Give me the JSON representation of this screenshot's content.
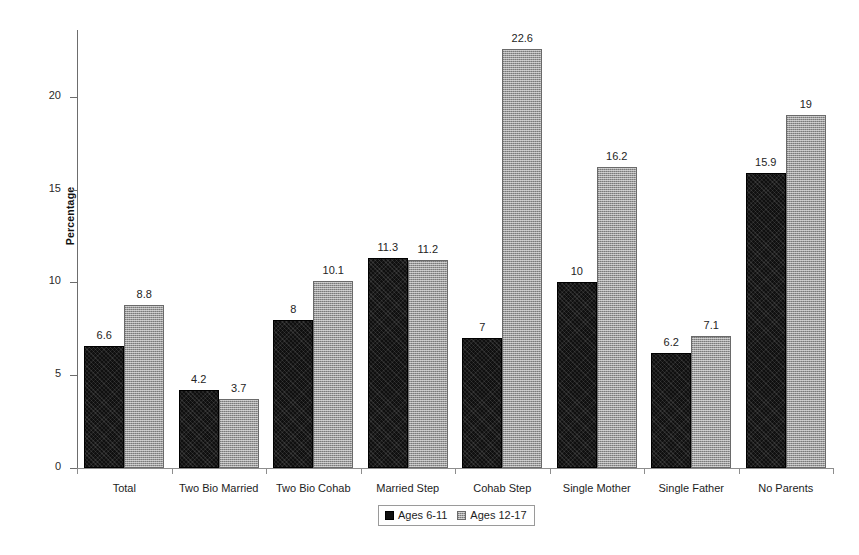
{
  "chart_data": {
    "type": "bar",
    "title": "",
    "xlabel": "",
    "ylabel": "Percentage",
    "ylim": [
      0,
      23.6
    ],
    "yticks": [
      0,
      5,
      10,
      15,
      20
    ],
    "ytick_labels": [
      "0",
      "5",
      "10",
      "15",
      "20"
    ],
    "grid": false,
    "legend_position": "bottom-center",
    "categories": [
      "Total",
      "Two Bio Married",
      "Two Bio Cohab",
      "Married Step",
      "Cohab Step",
      "Single Mother",
      "Single Father",
      "No Parents"
    ],
    "series": [
      {
        "name": "Ages 6-11",
        "color": "#101010",
        "values": [
          6.6,
          4.2,
          8,
          11.3,
          7,
          10,
          6.2,
          15.9
        ],
        "value_labels": [
          "6.6",
          "4.2",
          "8",
          "11.3",
          "7",
          "10",
          "6.2",
          "15.9"
        ]
      },
      {
        "name": "Ages 12-17",
        "color": "#9b9b9b",
        "values": [
          8.8,
          3.7,
          10.1,
          11.2,
          22.6,
          16.2,
          7.1,
          19
        ],
        "value_labels": [
          "8.8",
          "3.7",
          "10.1",
          "11.2",
          "22.6",
          "16.2",
          "7.1",
          "19"
        ]
      }
    ]
  },
  "legend": {
    "entries": [
      {
        "label": "Ages 6-11"
      },
      {
        "label": "Ages 12-17"
      }
    ]
  }
}
